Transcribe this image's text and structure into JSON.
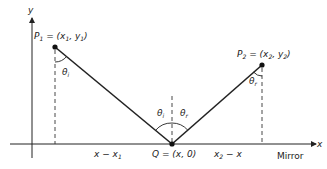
{
  "diagram": {
    "axes": {
      "x_label": "x",
      "y_label": "y",
      "mirror_label": "Mirror"
    },
    "points": {
      "p1": {
        "name": "P",
        "sub": "1",
        "eq": " = (x",
        "sub_x": "1",
        "comma": ", y",
        "sub_y": "1",
        "close": ")"
      },
      "p2": {
        "name": "P",
        "sub": "2",
        "eq": " = (x",
        "sub_x": "2",
        "comma": ", y",
        "sub_y": "2",
        "close": ")"
      },
      "q": {
        "label": "Q = (x, 0)"
      }
    },
    "angles": {
      "theta_i": {
        "sym": "θ",
        "sub": "i"
      },
      "theta_r": {
        "sym": "θ",
        "sub": "r"
      }
    },
    "distances": {
      "left": {
        "text": "x − x",
        "sub": "1"
      },
      "right": {
        "text": "x",
        "sub": "2",
        "rest": " − x"
      }
    },
    "colors": {
      "line": "#222222",
      "dash": "#333333"
    }
  }
}
